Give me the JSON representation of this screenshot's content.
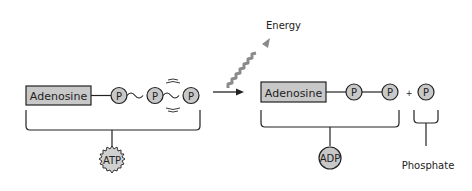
{
  "diagram": {
    "left": {
      "adenosine_label": "Adenosine",
      "phosphates": [
        "P",
        "P",
        "P"
      ],
      "molecule_label": "ATP"
    },
    "energy_label": "Energy",
    "right": {
      "adenosine_label": "Adenosine",
      "phosphates": [
        "P",
        "P"
      ],
      "plus": "+",
      "free_phosphate": "P",
      "molecule_label": "ADP",
      "phosphate_label": "Phosphate"
    },
    "colors": {
      "box_fill": "#c8c8c8",
      "circle_fill": "#c8c8c8",
      "stroke": "#222222",
      "energy_wave": "#8a8a8a"
    }
  }
}
